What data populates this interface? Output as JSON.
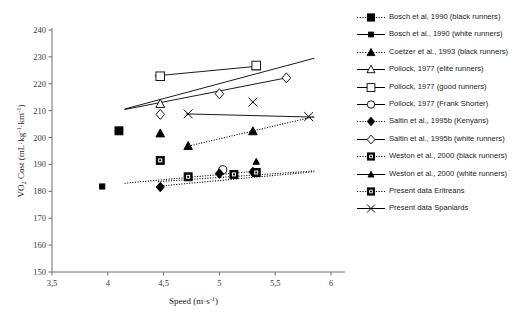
{
  "chart_data": {
    "type": "scatter",
    "title": "",
    "xlabel": "Speed (m·s⁻¹)",
    "ylabel": "VO₂ Cost (mL·kg⁻¹·km⁻¹)",
    "xlim": [
      3.5,
      6
    ],
    "ylim": [
      150,
      240
    ],
    "xticks": [
      "3,5",
      "4",
      "4,5",
      "5",
      "5,5",
      "6"
    ],
    "xtick_values": [
      3.5,
      4,
      4.5,
      5,
      5.5,
      6
    ],
    "yticks": [
      "150",
      "160",
      "170",
      "180",
      "190",
      "200",
      "210",
      "220",
      "230",
      "240"
    ],
    "ytick_values": [
      150,
      160,
      170,
      180,
      190,
      200,
      210,
      220,
      230,
      240
    ],
    "grid": false,
    "legend_position": "right",
    "series": [
      {
        "name": "Bosch et al, 1990 (black runners)",
        "marker": "filled-square",
        "line": "dotted",
        "points": [
          [
            4.1,
            202.5
          ]
        ]
      },
      {
        "name": "Bosch et al., 1990 (white runners)",
        "marker": "small-filled-square",
        "line": "solid",
        "points": [
          [
            3.95,
            181.8
          ]
        ]
      },
      {
        "name": "Coetzer et al., 1993 (black runners)",
        "marker": "filled-triangle",
        "line": "dotted",
        "points": [
          [
            4.47,
            201.5
          ],
          [
            4.72,
            196.8
          ],
          [
            5.3,
            202.3
          ]
        ]
      },
      {
        "name": "Pollock, 1977 (elite runners)",
        "marker": "open-triangle",
        "line": "solid",
        "points": [
          [
            4.47,
            212.5
          ],
          [
            5.33,
            226.5
          ]
        ]
      },
      {
        "name": "Pollock, 1977 (good runners)",
        "marker": "open-square",
        "line": "solid",
        "points": [
          [
            4.47,
            222.8
          ],
          [
            5.33,
            226.8
          ]
        ]
      },
      {
        "name": "Pollock, 1977 (Frank Shorter)",
        "marker": "open-circle",
        "line": "solid",
        "points": [
          [
            5.03,
            188.0
          ]
        ]
      },
      {
        "name": "Saltin et al., 1995b (Kenyans)",
        "marker": "filled-diamond",
        "line": "dotted",
        "points": [
          [
            4.47,
            181.6
          ],
          [
            5.0,
            186.6
          ],
          [
            5.3,
            187.2
          ]
        ]
      },
      {
        "name": "Saltin et al., 1995b (white runners)",
        "marker": "open-diamond",
        "line": "solid",
        "points": [
          [
            4.47,
            208.6
          ],
          [
            5.0,
            216.3
          ],
          [
            5.6,
            222.2
          ]
        ]
      },
      {
        "name": "Weston et al., 2000 (black runners)",
        "marker": "box-square",
        "line": "dotted",
        "points": [
          [
            4.47,
            191.5
          ]
        ]
      },
      {
        "name": "Weston et al., 2000 (white runners)",
        "marker": "small-filled-triangle",
        "line": "solid",
        "points": [
          [
            5.33,
            191.0
          ]
        ]
      },
      {
        "name": "Present data Eritreans",
        "marker": "box-square",
        "line": "dotted",
        "points": [
          [
            4.72,
            185.4
          ],
          [
            5.13,
            186.3
          ],
          [
            5.33,
            187.0
          ]
        ]
      },
      {
        "name": "Present data Spaniards",
        "marker": "cross-x",
        "line": "solid",
        "points": [
          [
            4.72,
            208.8
          ],
          [
            5.3,
            213.2
          ],
          [
            5.8,
            207.8
          ]
        ]
      }
    ],
    "trendlines": [
      {
        "name": "bosch-white-trend",
        "style": "dashdot",
        "from": [
          4.15,
          183.0
        ],
        "to": [
          5.33,
          187.5
        ]
      },
      {
        "name": "coetzer-trend",
        "style": "dotted",
        "from": [
          4.7,
          196.6
        ],
        "to": [
          5.85,
          207.8
        ]
      },
      {
        "name": "pollock-elite-trend",
        "style": "solid",
        "from": [
          4.15,
          210.6
        ],
        "to": [
          5.85,
          229.5
        ]
      },
      {
        "name": "pollock-good-trend",
        "style": "solid",
        "from": [
          4.42,
          222.9
        ],
        "to": [
          5.36,
          226.6
        ]
      },
      {
        "name": "saltin-white-trend",
        "style": "solid",
        "from": [
          4.15,
          210.4
        ],
        "to": [
          5.6,
          222.2
        ]
      },
      {
        "name": "kenyan-trend",
        "style": "dotted",
        "from": [
          4.45,
          181.9
        ],
        "to": [
          5.85,
          187.3
        ]
      },
      {
        "name": "spaniards-trend",
        "style": "solid",
        "from": [
          4.7,
          208.8
        ],
        "to": [
          5.85,
          207.6
        ]
      },
      {
        "name": "eritreans-trend",
        "style": "dotted",
        "from": [
          4.45,
          183.6
        ],
        "to": [
          5.85,
          187.6
        ]
      }
    ]
  },
  "legend": {
    "items": [
      {
        "label": "Bosch et al, 1990 (black runners)",
        "marker": "filled-square",
        "line": "dotted"
      },
      {
        "label": "Bosch et al., 1990 (white runners)",
        "marker": "small-filled-square",
        "line": "solid"
      },
      {
        "label": "Coetzer et al., 1993 (black runners)",
        "marker": "filled-triangle",
        "line": "dotted"
      },
      {
        "label": "Pollock, 1977 (elite runners)",
        "marker": "open-triangle",
        "line": "solid"
      },
      {
        "label": "Pollock, 1977 (good runners)",
        "marker": "open-square",
        "line": "solid"
      },
      {
        "label": "Pollock, 1977 (Frank Shorter)",
        "marker": "open-circle",
        "line": "solid"
      },
      {
        "label": "Saltin et al., 1995b (Kenyans)",
        "marker": "filled-diamond",
        "line": "dotted"
      },
      {
        "label": "Saltin et al., 1995b (white runners)",
        "marker": "open-diamond",
        "line": "solid"
      },
      {
        "label": "Weston et al., 2000 (black runners)",
        "marker": "box-square",
        "line": "dotted"
      },
      {
        "label": "Weston et al., 2000 (white runners)",
        "marker": "small-filled-triangle",
        "line": "solid"
      },
      {
        "label": "Present data Eritreans",
        "marker": "box-square",
        "line": "dotted"
      },
      {
        "label": "Present data Spaniards",
        "marker": "cross-x",
        "line": "solid"
      }
    ]
  },
  "colors": {
    "ink": "#000000",
    "axis": "#6f6f6f",
    "background": "#ffffff"
  }
}
